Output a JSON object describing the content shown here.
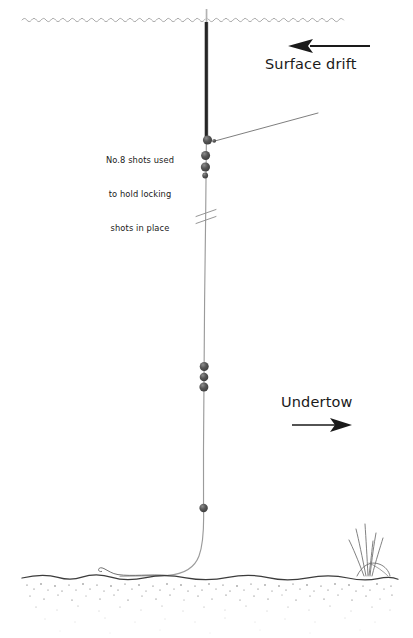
{
  "diagram": {
    "canvas": {
      "width": 413,
      "height": 638,
      "background": "#ffffff"
    },
    "colors": {
      "ink": "#1a1a1a",
      "line": "#8a8a8a",
      "float_body": "#2b2b2b",
      "float_antenna": "#bdbdbd",
      "shot": "#4a4a4a",
      "shot_highlight": "#7d7d7d",
      "waterline": "#9a9a9a",
      "bed_line": "#3c3c3c",
      "stipple": "#5a5a5a",
      "reed": "#6a6a6a"
    },
    "annotations": {
      "shot_note": {
        "lines": [
          "No.8 shots used",
          "to hold locking",
          "shots in place"
        ],
        "full_text": "No.8 shots used to hold locking shots in place"
      },
      "surface_drift": {
        "label": "Surface drift",
        "arrow_direction": "left"
      },
      "undertow": {
        "label": "Undertow",
        "arrow_direction": "right"
      }
    },
    "features": {
      "waterline_label": "water surface",
      "float_label": "waggler float",
      "mainline_label": "main line",
      "break_mark_label": "line break mark",
      "locking_shots_count": 4,
      "mid_shots_count": 3,
      "dropper_shots_count": 1,
      "hook_label": "hook on bottom",
      "riverbed_label": "riverbed",
      "reeds_label": "reeds"
    }
  }
}
